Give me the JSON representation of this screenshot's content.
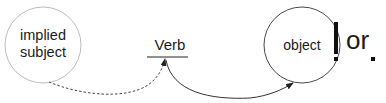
{
  "diagram": {
    "nodes": {
      "subject": {
        "label": "implied\nsubject",
        "line1": "implied",
        "line2": "subject",
        "stroke": "#b8b8b8"
      },
      "verb": {
        "label": "Verb"
      },
      "object": {
        "label": "object",
        "stroke": "#555555"
      }
    },
    "punctuation": {
      "exclamation": "!",
      "connector": "or",
      "period": "."
    },
    "edges": [
      {
        "from": "subject",
        "to": "verb",
        "style": "dashed"
      },
      {
        "from": "verb",
        "to": "object",
        "style": "solid"
      }
    ]
  }
}
